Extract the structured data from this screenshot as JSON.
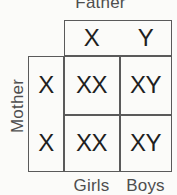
{
  "diagram": {
    "type": "punnett-square",
    "title_visible": false,
    "colors": {
      "background": "#fbfbf9",
      "grid_line": "#5a5a5a",
      "cell_text": "#1f1f1f",
      "axis_label_text": "#4e4e4e"
    }
  },
  "axes": {
    "top_label": "Father",
    "left_label": "Mother"
  },
  "father": {
    "alleles": [
      "X",
      "Y"
    ]
  },
  "mother": {
    "alleles": [
      "X",
      "X"
    ]
  },
  "offspring": {
    "column_headers": [
      "X",
      "Y"
    ],
    "row_headers": [
      "X",
      "X"
    ],
    "rows": [
      {
        "row_allele": "X",
        "cells": [
          "XX",
          "XY"
        ]
      },
      {
        "row_allele": "X",
        "cells": [
          "XX",
          "XY"
        ]
      }
    ]
  },
  "outcome_labels": {
    "column_1": "Girls",
    "column_2": "Boys"
  }
}
